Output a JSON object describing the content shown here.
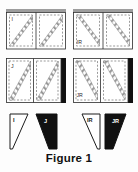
{
  "figure": {
    "caption": "Figure 1",
    "background_color": "#fdfdfd",
    "ink_color": "#1a1a1a",
    "hatch_color": "#8f8f8f",
    "gray_bar_color": "#9d9d9d",
    "black_bar_color": "#111111",
    "dashed_color": "#6e6e6e"
  },
  "panels": [
    {
      "id": "panel-i",
      "label": "I",
      "label_position": "top-left",
      "row": 0,
      "column": 0,
      "edge_bar": "top",
      "edge_bar_color": "#9d9d9d",
      "diagonal_direction": "rising",
      "cells": 2,
      "x": 6,
      "y": 9,
      "w": 60,
      "h": 40
    },
    {
      "id": "panel-ir",
      "label": "IR",
      "label_position": "bottom-left",
      "row": 0,
      "column": 1,
      "edge_bar": "top",
      "edge_bar_color": "#9d9d9d",
      "diagonal_direction": "falling",
      "cells": 2,
      "x": 73,
      "y": 9,
      "w": 60,
      "h": 40
    },
    {
      "id": "panel-j",
      "label": "J",
      "label_position": "top-left",
      "row": 1,
      "column": 0,
      "edge_bar": "right",
      "edge_bar_color": "#111111",
      "diagonal_direction": "rising",
      "cells": 2,
      "x": 6,
      "y": 58,
      "w": 60,
      "h": 44
    },
    {
      "id": "panel-jr",
      "label": "JR",
      "label_position": "bottom-left",
      "row": 1,
      "column": 1,
      "edge_bar": "right",
      "edge_bar_color": "#111111",
      "diagonal_direction": "falling",
      "cells": 2,
      "x": 73,
      "y": 58,
      "w": 60,
      "h": 44
    }
  ],
  "shapes": [
    {
      "id": "shape-i",
      "label": "I",
      "fill": "white",
      "fill_color": "#ffffff",
      "stroke_color": "#1a1a1a",
      "orientation": "normal",
      "label_color": "#1a1a1a",
      "x": 9,
      "y": 113,
      "w": 24,
      "h": 36
    },
    {
      "id": "shape-j",
      "label": "J",
      "fill": "black",
      "fill_color": "#111111",
      "stroke_color": "#111111",
      "orientation": "normal",
      "label_color": "#ffffff",
      "x": 35,
      "y": 113,
      "w": 24,
      "h": 36
    },
    {
      "id": "shape-ir",
      "label": "IR",
      "fill": "white",
      "fill_color": "#ffffff",
      "stroke_color": "#1a1a1a",
      "orientation": "mirrored",
      "label_color": "#1a1a1a",
      "x": 76,
      "y": 113,
      "w": 24,
      "h": 36
    },
    {
      "id": "shape-jr",
      "label": "JR",
      "fill": "black",
      "fill_color": "#111111",
      "stroke_color": "#111111",
      "orientation": "mirrored",
      "label_color": "#ffffff",
      "x": 102,
      "y": 113,
      "w": 24,
      "h": 36
    }
  ]
}
